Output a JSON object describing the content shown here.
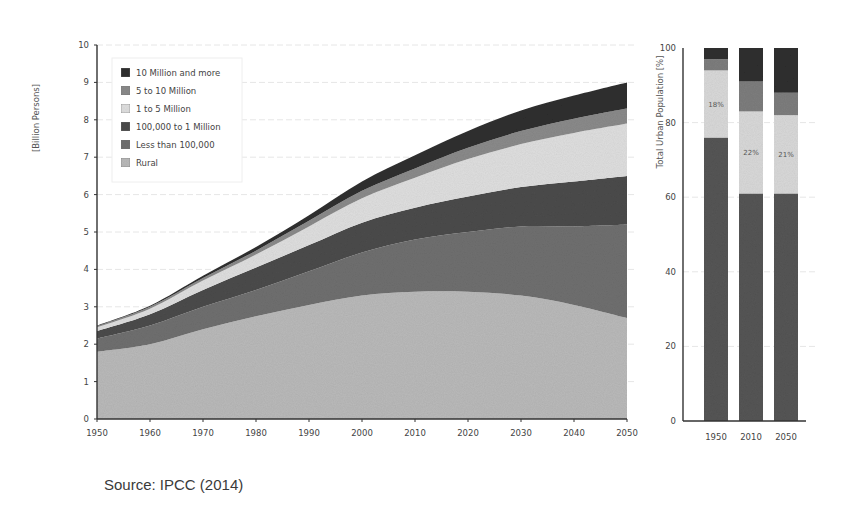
{
  "chart_data": [
    {
      "type": "area",
      "stacked": true,
      "title": "",
      "xlabel": "",
      "ylabel": "[Billion Persons]",
      "xlim": [
        1950,
        2050
      ],
      "ylim": [
        0,
        10
      ],
      "x_ticks": [
        "1950",
        "1960",
        "1970",
        "1980",
        "1990",
        "2000",
        "2010",
        "2020",
        "2030",
        "2040",
        "2050"
      ],
      "y_ticks": [
        "0",
        "1",
        "2",
        "3",
        "4",
        "5",
        "6",
        "7",
        "8",
        "9",
        "10"
      ],
      "grid": true,
      "legend_position": "upper-left",
      "x": [
        1950,
        1960,
        1970,
        1980,
        1990,
        2000,
        2010,
        2020,
        2030,
        2040,
        2050
      ],
      "series": [
        {
          "name": "Rural",
          "color": "#b9b9b9",
          "values": [
            1.8,
            2.0,
            2.4,
            2.75,
            3.05,
            3.3,
            3.4,
            3.4,
            3.3,
            3.05,
            2.7
          ]
        },
        {
          "name": "Less than 100,000",
          "color": "#6f6f6f",
          "values": [
            0.35,
            0.5,
            0.6,
            0.7,
            0.9,
            1.15,
            1.4,
            1.6,
            1.85,
            2.1,
            2.5
          ]
        },
        {
          "name": "100,000 to 1 Million",
          "color": "#4b4b4b",
          "values": [
            0.2,
            0.3,
            0.45,
            0.6,
            0.7,
            0.8,
            0.85,
            0.95,
            1.05,
            1.2,
            1.3
          ]
        },
        {
          "name": "1 to 5 Million",
          "color": "#dedede",
          "values": [
            0.1,
            0.15,
            0.25,
            0.35,
            0.5,
            0.65,
            0.8,
            1.0,
            1.15,
            1.3,
            1.4
          ]
        },
        {
          "name": "5 to 10 Million",
          "color": "#8a8a8a",
          "values": [
            0.03,
            0.05,
            0.07,
            0.1,
            0.15,
            0.2,
            0.25,
            0.3,
            0.35,
            0.38,
            0.4
          ]
        },
        {
          "name": "10 Million and more",
          "color": "#2f2f2f",
          "values": [
            0.02,
            0.03,
            0.06,
            0.1,
            0.15,
            0.25,
            0.35,
            0.45,
            0.55,
            0.62,
            0.7
          ]
        }
      ]
    },
    {
      "type": "bar",
      "stacked": true,
      "title": "",
      "xlabel": "",
      "ylabel": "Total Urban Population [%]",
      "ylim": [
        0,
        100
      ],
      "y_ticks": [
        "0",
        "20",
        "40",
        "60",
        "80",
        "100"
      ],
      "categories": [
        "1950",
        "2010",
        "2050"
      ],
      "grid": true,
      "series": [
        {
          "name": "Less than 1 Million",
          "color": "#555555",
          "values": [
            76,
            61,
            61
          ]
        },
        {
          "name": "1 to 5 Million",
          "color": "#d8d8d8",
          "values": [
            18,
            22,
            21
          ]
        },
        {
          "name": "5 to 10 Million",
          "color": "#7d7d7d",
          "values": [
            3,
            8,
            6
          ]
        },
        {
          "name": "10 Million and more",
          "color": "#2f2f2f",
          "values": [
            3,
            9,
            12
          ]
        }
      ],
      "annotations": [
        "18%",
        "22%",
        "21%"
      ]
    }
  ],
  "area": {
    "ylabel": "[Billion Persons]",
    "legend": [
      {
        "label": "10 Million and more"
      },
      {
        "label": "5 to 10 Million"
      },
      {
        "label": "1 to 5 Million"
      },
      {
        "label": "100,000 to 1 Million"
      },
      {
        "label": "Less than 100,000"
      },
      {
        "label": "Rural"
      }
    ]
  },
  "bars": {
    "ylabel": "Total Urban Population [%]",
    "labels": [
      "18%",
      "22%",
      "21%"
    ]
  },
  "source": "Source: IPCC (2014)"
}
